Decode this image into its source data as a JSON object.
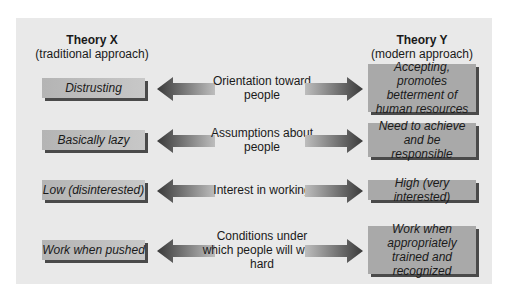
{
  "headers": {
    "left": {
      "title": "Theory X",
      "subtitle": "(traditional approach)"
    },
    "right": {
      "title": "Theory Y",
      "subtitle": "(modern approach)"
    }
  },
  "rows": [
    {
      "left": "Distrusting",
      "middle": "Orientation toward people",
      "right": "Accepting, promotes betterment of human resources"
    },
    {
      "left": "Basically lazy",
      "middle": "Assumptions about people",
      "right": "Need to achieve and be responsible"
    },
    {
      "left": "Low (disinterested)",
      "middle": "Interest in working",
      "right": "High (very interested)"
    },
    {
      "left": "Work when pushed",
      "middle": "Conditions under which people will work hard",
      "right": "Work when appropriately trained and recognized"
    }
  ],
  "colors": {
    "panel": "#e9e9e9",
    "left_box": "#bdbdbd",
    "right_box": "#a9a9a9",
    "shadow": "#4a4a4a",
    "arrow": "#555555"
  }
}
